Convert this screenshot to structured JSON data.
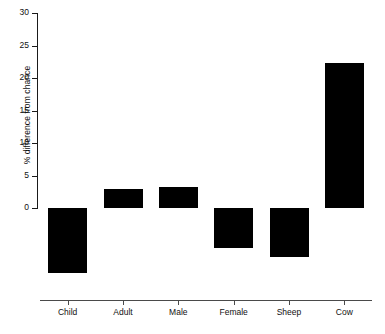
{
  "chart_data": {
    "type": "bar",
    "title": "",
    "subtitle": "",
    "xlabel": "",
    "ylabel": "% difference from chance",
    "categories": [
      "Child",
      "Adult",
      "Male",
      "Female",
      "Sheep",
      "Cow"
    ],
    "values": [
      -10.0,
      3.0,
      3.2,
      -6.2,
      -7.5,
      22.3
    ],
    "series": [
      {
        "name": "% difference from chance",
        "values": [
          -10.0,
          3.0,
          3.2,
          -6.2,
          -7.5,
          22.3
        ]
      }
    ],
    "ylim": [
      0,
      30
    ],
    "y_ticks": [
      0,
      5,
      10,
      15,
      20,
      25,
      30
    ],
    "y_tick_labels": [
      "0",
      "5",
      "10",
      "15",
      "20",
      "25",
      "30"
    ],
    "grid": false,
    "legend": false,
    "legend_position": "none",
    "bar_color": "#000000",
    "axis_color": "#1a1a1a",
    "background_color": "#ffffff"
  }
}
